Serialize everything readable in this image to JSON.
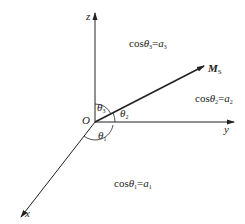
{
  "diagram": {
    "axes": {
      "z_label": "z",
      "y_label": "y",
      "x_label": "x",
      "origin_label": "O"
    },
    "vector": {
      "label_main": "M",
      "label_sub": "S"
    },
    "angles": {
      "theta1": {
        "sym": "θ",
        "sub": "1"
      },
      "theta2": {
        "sym": "θ",
        "sub": "2"
      },
      "theta3": {
        "sym": "θ",
        "sub": "3"
      }
    },
    "equations": {
      "eq3": {
        "cos": "cos",
        "theta": "θ",
        "theta_sub": "3",
        "eq": "=",
        "a": "a",
        "a_sub": "3"
      },
      "eq2": {
        "cos": "cos",
        "theta": "θ",
        "theta_sub": "2",
        "eq": "=",
        "a": "a",
        "a_sub": "2"
      },
      "eq1": {
        "cos": "cos",
        "theta": "θ",
        "theta_sub": "1",
        "eq": "=",
        "a": "a",
        "a_sub": "1"
      }
    },
    "colors": {
      "line": "#222222",
      "background": "#ffffff"
    }
  }
}
